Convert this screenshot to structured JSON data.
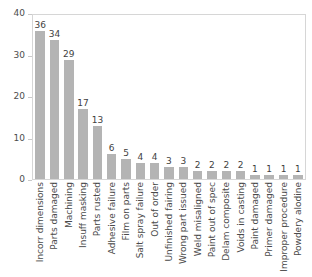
{
  "chart_data": {
    "type": "bar",
    "title": "",
    "subtitle": "",
    "xlabel": "",
    "ylabel": "",
    "ylim": [
      0,
      40
    ],
    "yticks": [
      0,
      10,
      20,
      30,
      40
    ],
    "grid": false,
    "legend": null,
    "bar_color": "#b4b4b4",
    "value_labels_shown": true,
    "categories": [
      "Incorr dimensions",
      "Parts damaged",
      "Machining",
      "Insuff masking",
      "Parts rusted",
      "Adhesive failure",
      "Film on parts",
      "Salt spray failure",
      "Out of order",
      "Unfinished fairing",
      "Wrong part issued",
      "Weld misaligned",
      "Paint out of spec",
      "Delam composite",
      "Voids in casting",
      "Paint damaged",
      "Primer damaged",
      "Improper procedure",
      "Powdery alodine"
    ],
    "values": [
      36,
      34,
      29,
      17,
      13,
      6,
      5,
      4,
      4,
      3,
      3,
      2,
      2,
      2,
      2,
      1,
      1,
      1,
      1
    ]
  }
}
